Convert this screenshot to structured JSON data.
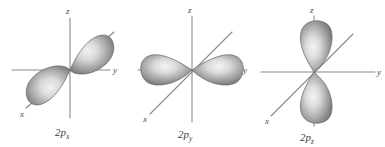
{
  "figure": {
    "background_color": "#ffffff",
    "axis_color": "#8a8a8a",
    "lobe_edge_color": "#636363",
    "lobe_dark_color": "#767676",
    "lobe_light_color": "#e8e8e8",
    "label_color": "#3d3d3d"
  },
  "panels": [
    {
      "id": "2px",
      "label_main": "2p",
      "label_sub": "x",
      "orbital_name": "2p_x",
      "lobe_orientation": "diagonal",
      "lobe_count": 2,
      "axes": [
        {
          "name": "z",
          "label": "z",
          "direction": "vertical"
        },
        {
          "name": "y",
          "label": "y",
          "direction": "horizontal"
        },
        {
          "name": "x",
          "label": "x",
          "direction": "diagonal"
        }
      ]
    },
    {
      "id": "2py",
      "label_main": "2p",
      "label_sub": "y",
      "orbital_name": "2p_y",
      "lobe_orientation": "horizontal",
      "lobe_count": 2,
      "axes": [
        {
          "name": "z",
          "label": "z",
          "direction": "vertical"
        },
        {
          "name": "y",
          "label": "y",
          "direction": "horizontal"
        },
        {
          "name": "x",
          "label": "x",
          "direction": "diagonal"
        }
      ]
    },
    {
      "id": "2pz",
      "label_main": "2p",
      "label_sub": "z",
      "orbital_name": "2p_z",
      "lobe_orientation": "vertical",
      "lobe_count": 2,
      "axes": [
        {
          "name": "z",
          "label": "z",
          "direction": "vertical"
        },
        {
          "name": "y",
          "label": "y",
          "direction": "horizontal"
        },
        {
          "name": "x",
          "label": "x",
          "direction": "diagonal"
        }
      ]
    }
  ]
}
